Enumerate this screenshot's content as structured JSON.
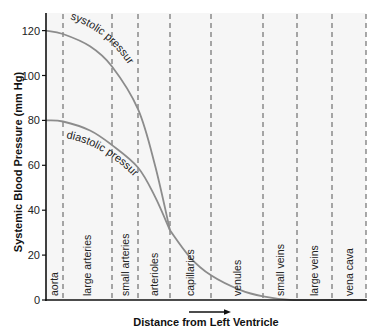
{
  "chart_data": {
    "type": "line",
    "title": "",
    "xlabel": "Distance from Left Ventricle",
    "ylabel": "Systemic Blood Pressure (mm Hg)",
    "ylim": [
      0,
      125
    ],
    "yticks": [
      0,
      20,
      40,
      60,
      80,
      100,
      120
    ],
    "grid": "vertical dashed segment dividers",
    "segments": [
      "aorta",
      "large arteries",
      "small arteries",
      "arterioles",
      "capillaries",
      "venules",
      "small veins",
      "large veins",
      "vena cava"
    ],
    "series": [
      {
        "name": "systolic pressure",
        "points_by_boundary": [
          {
            "x": "start",
            "y": 120
          },
          {
            "x": "aorta|large arteries",
            "y": 118
          },
          {
            "x": "large arteries|small arteries",
            "y": 104
          },
          {
            "x": "small arteries|arterioles",
            "y": 85
          },
          {
            "x": "arterioles|capillaries",
            "y": 31
          }
        ]
      },
      {
        "name": "diastolic pressure",
        "points_by_boundary": [
          {
            "x": "start",
            "y": 80
          },
          {
            "x": "aorta|large arteries",
            "y": 80
          },
          {
            "x": "large arteries|small arteries",
            "y": 69
          },
          {
            "x": "small arteries|arterioles",
            "y": 59
          },
          {
            "x": "arterioles|capillaries",
            "y": 31
          }
        ]
      },
      {
        "name": "mean (merged) pressure after arterioles",
        "points_by_boundary": [
          {
            "x": "arterioles|capillaries",
            "y": 31
          },
          {
            "x": "capillaries|venules",
            "y": 11
          },
          {
            "x": "venules|small veins",
            "y": 2
          },
          {
            "x": "small veins|large veins",
            "y": 0
          },
          {
            "x": "large veins|vena cava",
            "y": 0
          },
          {
            "x": "end",
            "y": 0
          }
        ]
      }
    ],
    "annotations": [
      "systolic pressure",
      "diastolic pressure",
      "arrow → under x-axis indicating direction of flow"
    ]
  },
  "labels": {
    "systolic": "systolic pressure",
    "diastolic": "diastolic pressure",
    "xlabel": "Distance from Left Ventricle",
    "ylabel": "Systemic Blood Pressure (mm Hg)"
  },
  "colors": {
    "curve": "#8c8c8c",
    "axis": "#111111",
    "divider": "#555555",
    "plot_bg": "#f6f6f6"
  }
}
